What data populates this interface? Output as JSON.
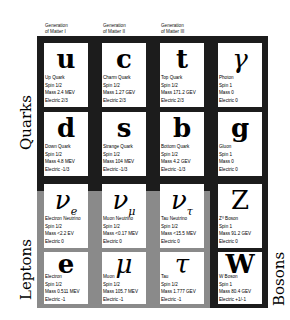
{
  "generations": [
    {
      "line1": "Generation",
      "line2": "of Matter I"
    },
    {
      "line1": "Generation",
      "line2": "of Matter II"
    },
    {
      "line1": "Generation",
      "line2": "of Matter III"
    }
  ],
  "groups": {
    "quarks": "Quarks",
    "leptons": "Leptons",
    "bosons": "Bosons"
  },
  "colors": {
    "quark_frame": "#1c1c1c",
    "lepton_frame": "#8a8a8a",
    "boson_frame": "#1c1c1c",
    "cell": "#ffffff"
  },
  "particles": [
    {
      "symbol": "u",
      "name": "Up Quark",
      "spin": "Spin 1/2",
      "mass": "Mass 2.4 MEV",
      "charge": "Electric 2/3"
    },
    {
      "symbol": "c",
      "name": "Charm Quark",
      "spin": "Spin 1/2",
      "mass": "Mass 1.27 GEV",
      "charge": "Electric 2/3"
    },
    {
      "symbol": "t",
      "name": "Top Quark",
      "spin": "Spin 1/2",
      "mass": "Mass 171.2 GEV",
      "charge": "Electric 2/3"
    },
    {
      "symbol": "γ",
      "name": "Photon",
      "spin": "Spin 1",
      "mass": "Mass 0",
      "charge": "Electric 0"
    },
    {
      "symbol": "d",
      "name": "Down Quark",
      "spin": "Spin 1/2",
      "mass": "Mass 4.8 MEV",
      "charge": "Electric -1/3"
    },
    {
      "symbol": "s",
      "name": "Strange Quark",
      "spin": "Spin 1/2",
      "mass": "Mass 104 MEV",
      "charge": "Electric -1/3"
    },
    {
      "symbol": "b",
      "name": "Bottom Quark",
      "spin": "Spin 1/2",
      "mass": "Mass 4.2 GEV",
      "charge": "Electric -1/3"
    },
    {
      "symbol": "g",
      "name": "Gluon",
      "spin": "Spin 1",
      "mass": "Mass 0",
      "charge": "Electric 0"
    },
    {
      "symbol": "ν",
      "sub": "e",
      "name": "Electron Neutrino",
      "spin": "Spin 1/2",
      "mass": "Mass <2.2 EV",
      "charge": "Electric 0"
    },
    {
      "symbol": "ν",
      "sub": "μ",
      "name": "Muon Neutrino",
      "spin": "Spin 1/2",
      "mass": "Mass <0.17 MEV",
      "charge": "Electric 0"
    },
    {
      "symbol": "ν",
      "sub": "τ",
      "name": "Tau Neutrino",
      "spin": "Spin 1/2",
      "mass": "Mass <15.5 MEV",
      "charge": "Electric 0"
    },
    {
      "symbol": "Z",
      "name": "Z⁰ Boson",
      "spin": "Spin 1",
      "mass": "Mass 91.2 GEV",
      "charge": "Electric 0"
    },
    {
      "symbol": "e",
      "name": "Electron",
      "spin": "Spin 1/2",
      "mass": "Mass 0.511 MEV",
      "charge": "Electric -1"
    },
    {
      "symbol": "μ",
      "name": "Muon",
      "spin": "Spin 1/2",
      "mass": "Mass 105.7 MEV",
      "charge": "Electric -1"
    },
    {
      "symbol": "τ",
      "name": "Tau",
      "spin": "Spin 1/2",
      "mass": "Mass 1.777 GEV",
      "charge": "Electric -1"
    },
    {
      "symbol": "W",
      "name": "W Boson",
      "spin": "Spin 1",
      "mass": "Mass 80.4 GEV",
      "charge": "Electric +1/-1"
    }
  ]
}
